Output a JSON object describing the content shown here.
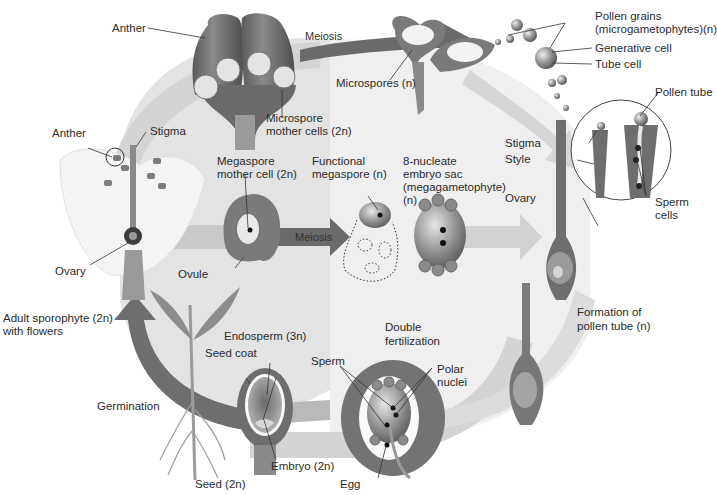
{
  "colors": {
    "background": "#ffffff",
    "cycle_band": "#d9d9d9",
    "panel_left": "#e4e4e4",
    "panel_right": "#f1f1f1",
    "tissue_dark": "#6e6e6e",
    "tissue_mid": "#8c8c8c",
    "arrow_dark": "#6a6a6a",
    "arrow_light": "#cfcfcf"
  },
  "arrows": {
    "meiosis_top": "Meiosis",
    "meiosis_middle": "Meiosis"
  },
  "labels": {
    "anther_top": "Anther",
    "microspore_mother_cells_1": "Microspore",
    "microspore_mother_cells_2": "mother cells (2n)",
    "microspores": "Microspores (n)",
    "pollen_grains_1": "Pollen grains",
    "pollen_grains_2": "(microgametophytes)(n)",
    "generative_cell": "Generative cell",
    "tube_cell": "Tube cell",
    "pollen_tube": "Pollen tube",
    "stigma_right": "Stigma",
    "style_right": "Style",
    "ovary_right": "Ovary",
    "sperm_cells_1": "Sperm",
    "sperm_cells_2": "cells",
    "anther_left": "Anther",
    "stigma_left": "Stigma",
    "ovary_left": "Ovary",
    "megaspore_mother_cell_1": "Megaspore",
    "megaspore_mother_cell_2": "mother cell (2n)",
    "ovule": "Ovule",
    "functional_megaspore_1": "Functional",
    "functional_megaspore_2": "megaspore (n)",
    "embryo_sac_1": "8-nucleate",
    "embryo_sac_2": "embryo sac",
    "embryo_sac_3": "(megagametophyte)",
    "embryo_sac_4": "(n)",
    "adult_sporophyte_1": "Adult sporophyte (2n)",
    "adult_sporophyte_2": "with flowers",
    "formation_pollen_tube_1": "Formation of",
    "formation_pollen_tube_2": "pollen tube (n)",
    "double_fertilization_1": "Double",
    "double_fertilization_2": "fertilization",
    "endosperm": "Endosperm (3n)",
    "seed_coat": "Seed coat",
    "sperm": "Sperm",
    "polar_nuclei_1": "Polar",
    "polar_nuclei_2": "nuclei",
    "germination": "Germination",
    "embryo": "Embryo (2n)",
    "seed": "Seed (2n)",
    "egg": "Egg"
  }
}
